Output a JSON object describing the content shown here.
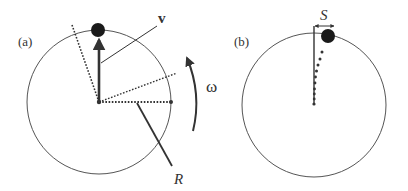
{
  "diagram": {
    "colors": {
      "stroke": "#333333",
      "circle": "#555555",
      "ball": "#1a1a1a",
      "background": "#ffffff"
    },
    "panel_a": {
      "label": "(a)",
      "velocity_label": "v",
      "radius_label": "R",
      "angular_velocity_label": "ω"
    },
    "panel_b": {
      "label": "(b)",
      "displacement_label": "S"
    }
  }
}
